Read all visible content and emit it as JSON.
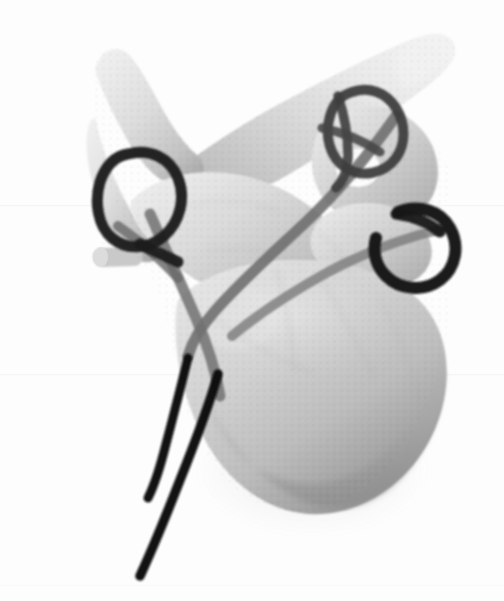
{
  "scene": {
    "title": "3D surface rendering of cervical vertebra with posterior cerclage wiring",
    "modality": "3D volume-rendered CT reconstruction",
    "orientation": "oblique posterolateral view",
    "background_color": "#fdfdfd",
    "width": 504,
    "height": 601
  },
  "palette": {
    "background": "#fdfdfd",
    "bone_light": "#dcdcdc",
    "bone_mid": "#c6c6c6",
    "bone_shadow": "#9a9a9a",
    "bone_deep_shadow": "#7e7e7e",
    "bone_highlight": "#ebebeb",
    "wire_black": "#121212",
    "wire_dark": "#2b2b2b",
    "wire_translucent": "#6e6e6e",
    "wire_translucent_soft": "#818181",
    "artifact_line": "#f2f2f3"
  },
  "anatomy": [
    {
      "id": "spinous-process",
      "label": "Spinous process",
      "region": "upper-left",
      "approx_center": [
        110,
        130
      ]
    },
    {
      "id": "lamina",
      "label": "Lamina",
      "region": "left-middle",
      "approx_center": [
        160,
        230
      ]
    },
    {
      "id": "pedicle-nub",
      "label": "Pedicle screw nub",
      "region": "left-edge",
      "approx_center": [
        105,
        258
      ]
    },
    {
      "id": "vertebral-body",
      "label": "Vertebral body",
      "region": "center-lower",
      "approx_center": [
        300,
        370
      ]
    },
    {
      "id": "superior-articular-process",
      "label": "Superior articular process",
      "region": "upper-right",
      "approx_center": [
        370,
        150
      ]
    },
    {
      "id": "transverse-process",
      "label": "Transverse process",
      "region": "top-right",
      "approx_center": [
        430,
        70
      ]
    },
    {
      "id": "inferior-articular-facet",
      "label": "Inferior articular facet",
      "region": "right-middle",
      "approx_center": [
        400,
        245
      ]
    }
  ],
  "hardware": [
    {
      "id": "wire-loop-spinous",
      "label": "Cerclage wire loop around spinous process",
      "shade": "#1c1c1c",
      "stroke_width": 11
    },
    {
      "id": "wire-loop-superior-facet",
      "label": "Cerclage wire loop at superior articular process",
      "shade": "#3a3a3a",
      "stroke_width": 10
    },
    {
      "id": "wire-loop-lateral",
      "label": "Cerclage wire loop at lateral facet",
      "shade": "#141414",
      "stroke_width": 12
    },
    {
      "id": "wire-strand-anterior",
      "label": "Wire strand crossing vertebral body",
      "shade": "#6e6e6e",
      "stroke_width": 10
    },
    {
      "id": "wire-strand-posterior",
      "label": "Wire strand crossing lamina",
      "shade": "#7a7a7a",
      "stroke_width": 10
    },
    {
      "id": "wire-tail-left",
      "label": "Free wire tail, left",
      "shade": "#101010",
      "stroke_width": 9
    },
    {
      "id": "wire-tail-right",
      "label": "Free wire tail, right",
      "shade": "#101010",
      "stroke_width": 9
    }
  ],
  "artifacts": [
    {
      "id": "scan-line-upper",
      "y": 205
    },
    {
      "id": "scan-line-lower",
      "y": 374
    }
  ]
}
